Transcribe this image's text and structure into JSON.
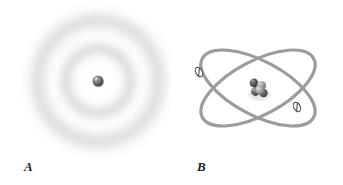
{
  "figure": {
    "background_color": "#ffffff",
    "width": 343,
    "height": 185,
    "caption_font_style": "italic-serif"
  },
  "panels": [
    {
      "id": "a",
      "label": "A",
      "title": "Electron cloud model",
      "nucleus": {
        "name": "nucleus-sphere",
        "cx": 98,
        "cy": 81,
        "r": 5.5,
        "base_color": "#6e6e6e",
        "highlight_color": "#c8c8c8",
        "shadow_color": "#3a3a3a"
      },
      "electron_cloud": {
        "name": "electron-cloud",
        "center_x": 98,
        "center_y": 81,
        "ring_color": "#b9b9b9",
        "rings": [
          {
            "name": "inner-cloud-ring",
            "radius": 32,
            "thickness": 15,
            "opacity": 0.5
          },
          {
            "name": "outer-cloud-ring",
            "radius": 58,
            "thickness": 18,
            "opacity": 0.42
          }
        ]
      }
    },
    {
      "id": "b",
      "label": "B",
      "title": "Bohr orbital model",
      "center_x": 258,
      "center_y": 88,
      "orbits": [
        {
          "name": "orbit-ellipse-1",
          "rotation_deg": -28,
          "rx": 63,
          "ry": 27,
          "stroke_color": "#9c9c9c",
          "stroke_width": 3.2
        },
        {
          "name": "orbit-ellipse-2",
          "rotation_deg": 28,
          "rx": 63,
          "ry": 27,
          "stroke_color": "#9c9c9c",
          "stroke_width": 3.2
        }
      ],
      "electrons": [
        {
          "name": "electron-marker-left",
          "cx": 199,
          "cy": 72,
          "rx": 3.2,
          "ry": 5.0,
          "rotation_deg": -28,
          "stroke_color": "#4a4a4a",
          "fill_color": "#ffffff",
          "slash": true
        },
        {
          "name": "electron-marker-right",
          "cx": 297,
          "cy": 107,
          "rx": 3.2,
          "ry": 5.0,
          "rotation_deg": -28,
          "stroke_color": "#4a4a4a",
          "fill_color": "#ffffff",
          "slash": true
        }
      ],
      "nucleus_cluster": {
        "name": "nucleus-cluster",
        "particles": [
          {
            "name": "nucleon-1",
            "cx": 254.0,
            "cy": 83.0,
            "r": 4.4,
            "base_color": "#4f4f4f",
            "highlight_color": "#9a9a9a"
          },
          {
            "name": "nucleon-2",
            "cx": 261.5,
            "cy": 85.5,
            "r": 4.6,
            "base_color": "#8e8e8e",
            "highlight_color": "#d2d2d2"
          },
          {
            "name": "nucleon-3",
            "cx": 255.5,
            "cy": 91.5,
            "r": 4.4,
            "base_color": "#5c5c5c",
            "highlight_color": "#a6a6a6"
          },
          {
            "name": "nucleon-4",
            "cx": 263.5,
            "cy": 93.0,
            "r": 4.2,
            "base_color": "#5a5a5a",
            "highlight_color": "#a0a0a0"
          },
          {
            "name": "nucleon-5",
            "cx": 259.5,
            "cy": 90.0,
            "r": 4.0,
            "base_color": "#9b9b9b",
            "highlight_color": "#dcdcdc"
          }
        ]
      }
    }
  ]
}
